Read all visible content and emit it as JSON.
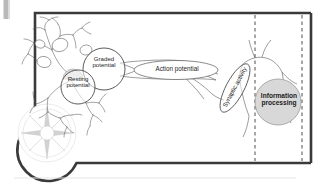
{
  "figure": {
    "type": "neuron-information-processing-diagram",
    "background_color": "#ffffff",
    "border_color": "#3a3a3a",
    "line_color": "#4a4a4a",
    "shade_color": "#d8d8d8",
    "labels": {
      "graded_potential": "Graded\npotential",
      "resting_potential": "Resting\npotential",
      "action_potential": "Action potential",
      "synaptic_activity": "Synaptic activity",
      "information_processing": "Information\nprocessing"
    },
    "decorations": {
      "compass_rose": "compass-rose-icon",
      "left_edge_tab": "page-edge-tab",
      "bottom_rule": "footer-rule"
    }
  }
}
